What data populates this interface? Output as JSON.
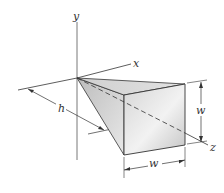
{
  "diagram": {
    "type": "3d-geometry",
    "labels": {
      "y_axis": "y",
      "x_axis": "x",
      "z_axis": "z",
      "height": "h",
      "width_vertical": "w",
      "width_horizontal": "w"
    },
    "colors": {
      "line": "#333333",
      "face_light": "#e6e6e6",
      "face_dark": "#b8b8b8"
    }
  }
}
